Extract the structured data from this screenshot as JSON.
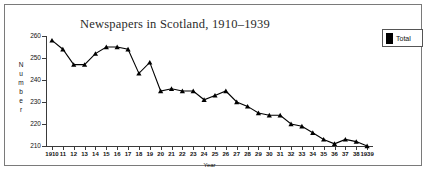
{
  "chart_data": {
    "type": "line",
    "title": "Newspapers in Scotland, 1910–1939",
    "xlabel": "Year",
    "ylabel": "Number",
    "ylim": [
      210,
      260
    ],
    "yticks": [
      210,
      220,
      230,
      240,
      250,
      260
    ],
    "grid": false,
    "legend_position": "top-right",
    "x": [
      1910,
      1911,
      1912,
      1913,
      1914,
      1915,
      1916,
      1917,
      1918,
      1919,
      1920,
      1921,
      1922,
      1923,
      1924,
      1925,
      1926,
      1927,
      1928,
      1929,
      1930,
      1931,
      1932,
      1933,
      1934,
      1935,
      1936,
      1937,
      1938,
      1939
    ],
    "tick_labels": [
      "1910",
      "11",
      "12",
      "13",
      "14",
      "15",
      "16",
      "17",
      "18",
      "19",
      "20",
      "21",
      "22",
      "23",
      "24",
      "25",
      "26",
      "27",
      "28",
      "29",
      "30",
      "31",
      "32",
      "33",
      "34",
      "35",
      "36",
      "37",
      "38",
      "1939"
    ],
    "series": [
      {
        "name": "Total",
        "color": "#000000",
        "marker": "triangle",
        "values": [
          258,
          254,
          247,
          247,
          252,
          255,
          255,
          254,
          243,
          248,
          235,
          236,
          235,
          235,
          231,
          233,
          235,
          230,
          228,
          225,
          224,
          224,
          220,
          219,
          216,
          213,
          211,
          213,
          212,
          210
        ]
      }
    ]
  },
  "legend": {
    "entries": [
      {
        "label": "Total",
        "color": "#000000"
      }
    ]
  },
  "axis": {
    "y_title_letters": [
      "N",
      "u",
      "m",
      "b",
      "e",
      "r"
    ]
  }
}
